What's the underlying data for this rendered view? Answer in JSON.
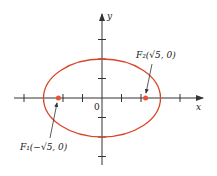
{
  "diagram": {
    "type": "ellipse-foci",
    "equation_params": {
      "a": 3,
      "b": 2,
      "c_squared": 5
    },
    "axes": {
      "x_label": "x",
      "y_label": "y",
      "origin_label": "0",
      "x_ticks": [
        -4,
        -3,
        -2,
        -1,
        1,
        2,
        3,
        4
      ],
      "y_ticks": [
        -3,
        -2,
        -1,
        1,
        2,
        3
      ]
    },
    "foci": [
      {
        "name": "F1",
        "label": "F₁(−√5, 0)",
        "x": -2.236,
        "y": 0
      },
      {
        "name": "F2",
        "label": "F₂(√5, 0)",
        "x": 2.236,
        "y": 0
      }
    ],
    "colors": {
      "ellipse": "#d9472b",
      "focus": "#e8533a",
      "axis": "#333333"
    }
  }
}
